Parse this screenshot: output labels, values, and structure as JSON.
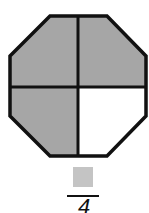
{
  "figure": {
    "shape": "octagon",
    "parts_total": 4,
    "parts_shaded": 3,
    "shaded_color": "#a6a6a6",
    "unshaded_color": "#ffffff",
    "outline_color": "#111111",
    "regions": [
      {
        "position": "top-left",
        "shaded": true
      },
      {
        "position": "top-right",
        "shaded": true
      },
      {
        "position": "bottom-left",
        "shaded": true
      },
      {
        "position": "bottom-right",
        "shaded": false
      }
    ]
  },
  "fraction": {
    "numerator": "",
    "numerator_box_color": "#c4c4c4",
    "denominator": "4"
  }
}
